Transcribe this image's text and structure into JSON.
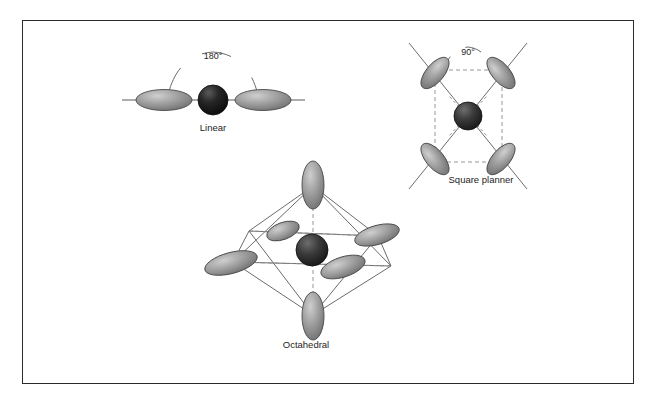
{
  "figure": {
    "background_color": "#ffffff",
    "frame_color": "#2b2b2b",
    "lobe_color": "#8f8f8f",
    "lobe_edge_color": "#4a4a4a",
    "metal_color": "#2a2a2a",
    "line_color": "#5a5a5a",
    "dash_color": "#777777",
    "text_color": "#1d1d1d"
  },
  "diagrams": [
    {
      "id": "linear",
      "label": "Linear",
      "angle_label": "180°",
      "geometry": "linear",
      "ligand_count": 2,
      "metal_center": {
        "x": 213,
        "y": 100
      }
    },
    {
      "id": "square-planar",
      "label": "Square planner",
      "angle_label": "90°",
      "geometry": "square-planar",
      "ligand_count": 4,
      "metal_center": {
        "x": 468,
        "y": 116
      }
    },
    {
      "id": "octahedral",
      "label": "Octahedral",
      "angle_label": "",
      "geometry": "octahedral",
      "ligand_count": 6,
      "metal_center": {
        "x": 312,
        "y": 250
      }
    }
  ]
}
